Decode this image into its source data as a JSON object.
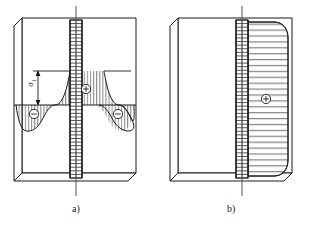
{
  "figure": {
    "type": "engineering-diagram",
    "background_color": "#ffffff",
    "line_color": "#1a1a1a",
    "hatch_color": "#4a4a4a"
  },
  "panels": [
    {
      "id": "a",
      "caption": "a)",
      "description": "Plate with central weld seam, stress diagram with positive peak at seam and negative lobes at sides",
      "block": {
        "x": 14,
        "y": 18,
        "width": 122,
        "height": 163,
        "bevel": 8
      },
      "centerline": {
        "x": 76,
        "top": 6,
        "bottom": 196
      },
      "weld_seam": {
        "x": 70,
        "width": 12,
        "top": 20,
        "bottom": 178,
        "rungs": 44
      },
      "baseline_y": 105,
      "top_reference_y": 71,
      "dimension": {
        "label": "σ",
        "subscript": "1",
        "arrow_x": 38,
        "arrow_top": 71,
        "arrow_bottom": 105
      },
      "markers": [
        {
          "sign": "+",
          "x": 84,
          "y": 89,
          "symbol": "⊕"
        },
        {
          "sign": "-",
          "x": 38,
          "y": 113,
          "symbol": "⊖"
        },
        {
          "sign": "-",
          "x": 117,
          "y": 113,
          "symbol": "⊖"
        }
      ]
    },
    {
      "id": "b",
      "caption": "b)",
      "description": "Plate with edge weld seam, uniform positive stress block with rounded outer corners",
      "block": {
        "x": 170,
        "y": 18,
        "width": 122,
        "height": 163,
        "bevel": 8
      },
      "centerline": {
        "x": 242,
        "top": 6,
        "bottom": 196
      },
      "weld_seam": {
        "x": 236,
        "width": 12,
        "top": 20,
        "bottom": 178,
        "rungs": 44
      },
      "stress_block": {
        "left": 248,
        "right": 288,
        "top": 22,
        "bottom": 176,
        "corner_radius": 14,
        "hatch_lines": 26
      },
      "markers": [
        {
          "sign": "+",
          "x": 268,
          "y": 99,
          "symbol": "⊕"
        }
      ]
    }
  ]
}
